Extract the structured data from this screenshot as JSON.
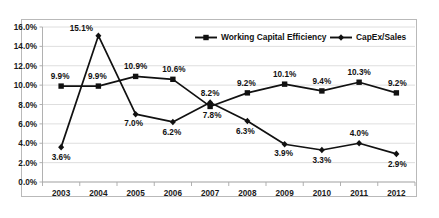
{
  "chart_data": {
    "type": "line",
    "title": "",
    "xlabel": "",
    "ylabel": "",
    "categories": [
      "2003",
      "2004",
      "2005",
      "2006",
      "2007",
      "2008",
      "2009",
      "2010",
      "2011",
      "2012"
    ],
    "ylim": [
      0.0,
      16.0
    ],
    "ytick_labels": [
      "0.0%",
      "2.0%",
      "4.0%",
      "6.0%",
      "8.0%",
      "10.0%",
      "12.0%",
      "14.0%",
      "16.0%"
    ],
    "ytick_values": [
      0.0,
      2.0,
      4.0,
      6.0,
      8.0,
      10.0,
      12.0,
      14.0,
      16.0
    ],
    "grid": true,
    "legend_position": "top-right-inside",
    "series": [
      {
        "name": "Working Capital Efficiency",
        "marker": "square",
        "color": "#111111",
        "values": [
          9.9,
          9.9,
          10.9,
          10.6,
          7.8,
          9.2,
          10.1,
          9.4,
          10.3,
          9.2
        ],
        "labels": [
          "9.9%",
          "9.9%",
          "10.9%",
          "10.6%",
          "7.8%",
          "9.2%",
          "10.1%",
          "9.4%",
          "10.3%",
          "9.2%"
        ]
      },
      {
        "name": "CapEx/Sales",
        "marker": "diamond",
        "color": "#111111",
        "values": [
          3.6,
          15.1,
          7.0,
          6.2,
          8.2,
          6.3,
          3.9,
          3.3,
          4.0,
          2.9
        ],
        "labels": [
          "3.6%",
          "15.1%",
          "7.0%",
          "6.2%",
          "8.2%",
          "6.3%",
          "3.9%",
          "3.3%",
          "4.0%",
          "2.9%"
        ]
      }
    ]
  },
  "legend": {
    "entries": [
      {
        "label": "Working Capital Efficiency",
        "marker": "square"
      },
      {
        "label": "CapEx/Sales",
        "marker": "diamond"
      }
    ]
  }
}
